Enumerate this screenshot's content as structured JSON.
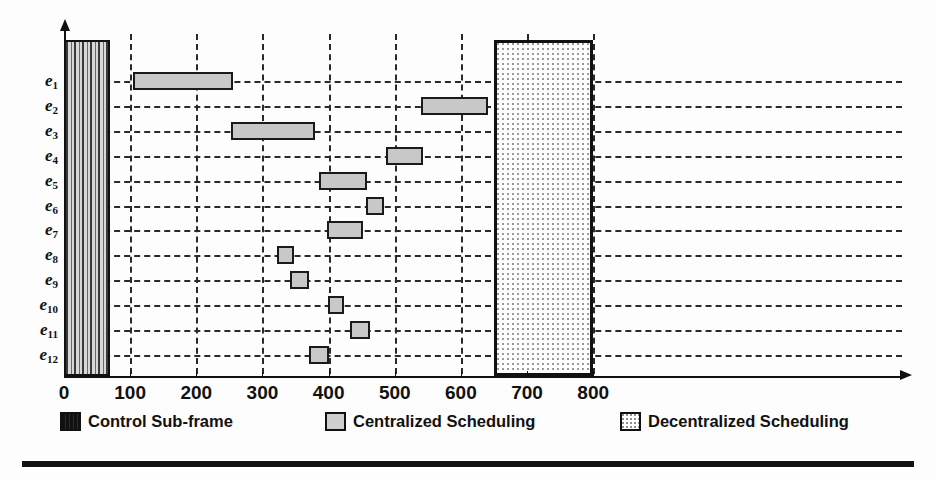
{
  "chart_data": {
    "type": "bar",
    "orientation": "horizontal",
    "title": "",
    "subtitle": "",
    "xlabel": "",
    "ylabel": "",
    "xlim": [
      0,
      820
    ],
    "ylim_categories": 12,
    "grid": "dashed-both-axes",
    "legend_position": "bottom",
    "x_ticks": [
      0,
      100,
      200,
      300,
      400,
      500,
      600,
      700,
      800
    ],
    "x_tick_labels": [
      "0",
      "100",
      "200",
      "300",
      "400",
      "500",
      "600",
      "700",
      "800"
    ],
    "categories": [
      "e1",
      "e2",
      "e3",
      "e4",
      "e5",
      "e6",
      "e7",
      "e8",
      "e9",
      "e10",
      "e11",
      "e12"
    ],
    "category_labels": [
      {
        "base": "e",
        "sub": "1"
      },
      {
        "base": "e",
        "sub": "2"
      },
      {
        "base": "e",
        "sub": "3"
      },
      {
        "base": "e",
        "sub": "4"
      },
      {
        "base": "e",
        "sub": "5"
      },
      {
        "base": "e",
        "sub": "6"
      },
      {
        "base": "e",
        "sub": "7"
      },
      {
        "base": "e",
        "sub": "8"
      },
      {
        "base": "e",
        "sub": "9"
      },
      {
        "base": "e",
        "sub": "10"
      },
      {
        "base": "e",
        "sub": "11"
      },
      {
        "base": "e",
        "sub": "12"
      }
    ],
    "series": [
      {
        "name": "Control Sub-frame",
        "kind": "full-height-block",
        "color": "#3a3a3a",
        "pattern": "vertical-stripes",
        "spans": [
          {
            "start": 0,
            "end": 70
          }
        ]
      },
      {
        "name": "Centralized Scheduling",
        "kind": "per-row-bar",
        "color": "#c8c8c8",
        "pattern": "solid-gray",
        "bars": [
          {
            "category": "e1",
            "start": 105,
            "end": 256
          },
          {
            "category": "e2",
            "start": 540,
            "end": 641
          },
          {
            "category": "e3",
            "start": 252,
            "end": 379
          },
          {
            "category": "e4",
            "start": 487,
            "end": 543
          },
          {
            "category": "e5",
            "start": 385,
            "end": 458
          },
          {
            "category": "e6",
            "start": 457,
            "end": 484
          },
          {
            "category": "e7",
            "start": 398,
            "end": 452
          },
          {
            "category": "e8",
            "start": 322,
            "end": 348
          },
          {
            "category": "e9",
            "start": 341,
            "end": 371
          },
          {
            "category": "e10",
            "start": 399,
            "end": 424
          },
          {
            "category": "e11",
            "start": 433,
            "end": 462
          },
          {
            "category": "e12",
            "start": 370,
            "end": 400
          }
        ]
      },
      {
        "name": "Decentralized Scheduling",
        "kind": "full-height-block",
        "color": "#ffffff",
        "pattern": "dotted-grid",
        "spans": [
          {
            "start": 650,
            "end": 800
          }
        ]
      }
    ]
  },
  "legend": {
    "items": [
      {
        "label": "Control Sub-frame",
        "swatch": "control-swatch"
      },
      {
        "label": "Centralized Scheduling",
        "swatch": "centralized-swatch"
      },
      {
        "label": "Decentralized Scheduling",
        "swatch": "decentralized-swatch"
      }
    ]
  },
  "colors": {
    "axis": "#111111",
    "grid": "#2a2a2a",
    "centralized_fill": "#c8c8c8",
    "control_fill": "#3a3a3a",
    "decentralized_fill": "#ffffff",
    "background": "#fdfdfd"
  }
}
